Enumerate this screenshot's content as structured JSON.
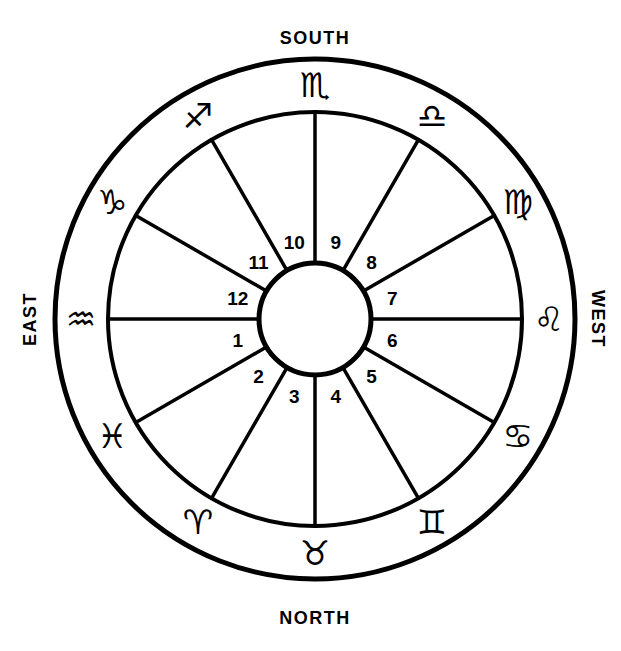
{
  "diagram": {
    "center_x": 315,
    "center_y": 319,
    "outer_radius": 260,
    "middle_radius": 207,
    "inner_radius": 56,
    "line_color": "#000000",
    "background_color": "#ffffff"
  },
  "cardinals": {
    "south": "SOUTH",
    "north": "NORTH",
    "east": "EAST",
    "west": "WEST"
  },
  "zodiac": [
    {
      "name": "scorpio",
      "glyph": "♏",
      "label": "Scorpio",
      "angle_deg": 90,
      "radius": 234
    },
    {
      "name": "libra",
      "glyph": "♎",
      "label": "Libra",
      "angle_deg": 60,
      "radius": 234
    },
    {
      "name": "virgo",
      "glyph": "♍",
      "label": "Virgo",
      "angle_deg": 30,
      "radius": 234
    },
    {
      "name": "leo",
      "glyph": "♌",
      "label": "Leo",
      "angle_deg": 0,
      "radius": 234
    },
    {
      "name": "cancer",
      "glyph": "♋",
      "label": "Cancer",
      "angle_deg": -30,
      "radius": 234
    },
    {
      "name": "gemini",
      "glyph": "♊",
      "label": "Gemini",
      "angle_deg": -60,
      "radius": 234
    },
    {
      "name": "taurus",
      "glyph": "♉",
      "label": "Taurus",
      "angle_deg": -90,
      "radius": 234
    },
    {
      "name": "aries",
      "glyph": "♈",
      "label": "Aries",
      "angle_deg": -120,
      "radius": 234
    },
    {
      "name": "pisces",
      "glyph": "♓",
      "label": "Pisces",
      "angle_deg": -150,
      "radius": 234
    },
    {
      "name": "aquarius",
      "glyph": "♒",
      "label": "Aquarius",
      "angle_deg": 180,
      "radius": 234
    },
    {
      "name": "capricorn",
      "glyph": "♑",
      "label": "Capricorn",
      "angle_deg": 150,
      "radius": 234
    },
    {
      "name": "sagittarius",
      "glyph": "♐",
      "label": "Sagittarius",
      "angle_deg": 120,
      "radius": 234
    }
  ],
  "houses": [
    {
      "number": "1",
      "angle_deg": 195,
      "radius": 80
    },
    {
      "number": "2",
      "angle_deg": 225,
      "radius": 80
    },
    {
      "number": "3",
      "angle_deg": 255,
      "radius": 80
    },
    {
      "number": "4",
      "angle_deg": 285,
      "radius": 80
    },
    {
      "number": "5",
      "angle_deg": 315,
      "radius": 80
    },
    {
      "number": "6",
      "angle_deg": 345,
      "radius": 80
    },
    {
      "number": "7",
      "angle_deg": 15,
      "radius": 80
    },
    {
      "number": "8",
      "angle_deg": 45,
      "radius": 80
    },
    {
      "number": "9",
      "angle_deg": 75,
      "radius": 80
    },
    {
      "number": "10",
      "angle_deg": 105,
      "radius": 80
    },
    {
      "number": "11",
      "angle_deg": 135,
      "radius": 80
    },
    {
      "number": "12",
      "angle_deg": 165,
      "radius": 80
    }
  ],
  "spokes": [
    {
      "name": "cusp-1-ascendant",
      "angle_deg": 180
    },
    {
      "name": "cusp-2",
      "angle_deg": 210
    },
    {
      "name": "cusp-3",
      "angle_deg": 240
    },
    {
      "name": "cusp-4",
      "angle_deg": 270
    },
    {
      "name": "cusp-5",
      "angle_deg": 300
    },
    {
      "name": "cusp-6",
      "angle_deg": 330
    },
    {
      "name": "cusp-7-descendant",
      "angle_deg": 0
    },
    {
      "name": "cusp-8",
      "angle_deg": 30
    },
    {
      "name": "cusp-9",
      "angle_deg": 60
    },
    {
      "name": "cusp-10-midheaven",
      "angle_deg": 90
    },
    {
      "name": "cusp-11",
      "angle_deg": 120
    },
    {
      "name": "cusp-12",
      "angle_deg": 150
    }
  ]
}
